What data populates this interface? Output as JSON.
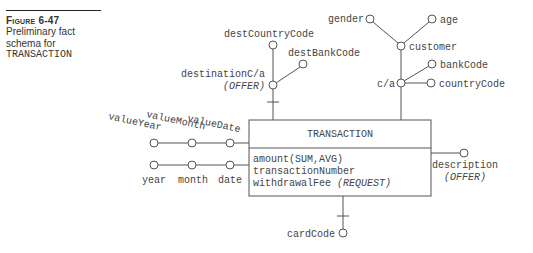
{
  "caption": {
    "figure_label": "Figure 6-47",
    "text": "Preliminary fact schema for",
    "fact_name": "TRANSACTION"
  },
  "fact": {
    "name": "TRANSACTION",
    "measures": [
      {
        "name": "amount",
        "suffix": "(SUM,AVG)"
      },
      {
        "name": "transactionNumber",
        "suffix": ""
      },
      {
        "name": "withdrawalFee",
        "suffix": "(REQUEST)"
      }
    ]
  },
  "attributes": {
    "destCountryCode": "destCountryCode",
    "destBankCode": "destBankCode",
    "destinationCa": "destinationC/a",
    "destinationCa_note": "(OFFER)",
    "gender": "gender",
    "age": "age",
    "customer": "customer",
    "ca": "c/a",
    "bankCode": "bankCode",
    "countryCode": "countryCode",
    "valueYear": "valueYear",
    "valueMonth": "valueMonth",
    "valueDate": "valueDate",
    "year": "year",
    "month": "month",
    "date": "date",
    "description": "description",
    "description_note": "(OFFER)",
    "cardCode": "cardCode"
  },
  "colors": {
    "line": "#555555",
    "text": "#444444",
    "caption_rule": "#222222"
  }
}
